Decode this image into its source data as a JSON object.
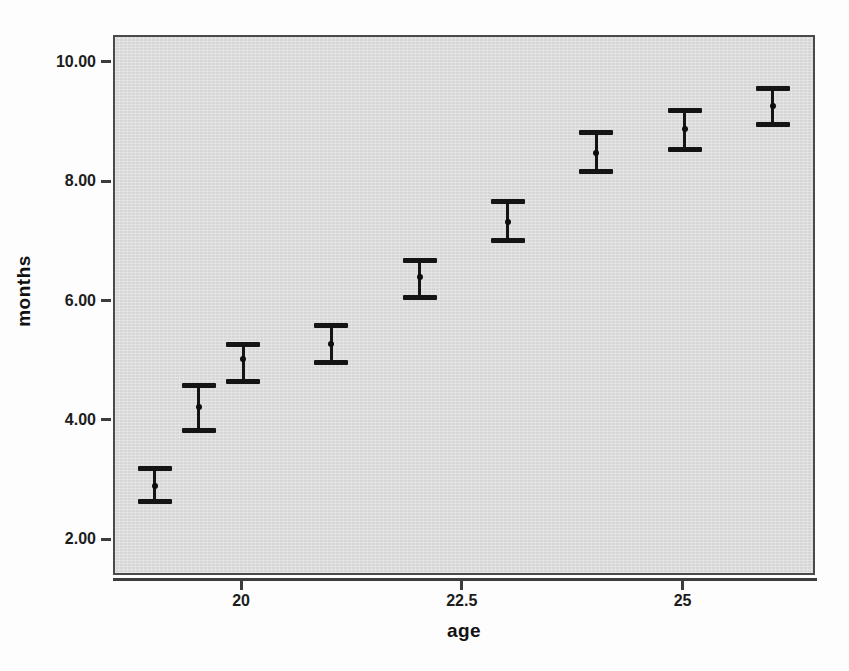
{
  "chart_data": {
    "type": "scatter",
    "title": "",
    "subtitle": "",
    "xlabel": "age",
    "ylabel": "months",
    "xlim": [
      18.55,
      26.5
    ],
    "ylim": [
      1.4,
      10.45
    ],
    "grid": false,
    "legend": null,
    "x_ticks": [
      "20",
      "22.5",
      "25"
    ],
    "x_tick_values": [
      20,
      22.5,
      25
    ],
    "y_ticks": [
      "10.00",
      "8.00",
      "6.00",
      "4.00",
      "2.00"
    ],
    "y_tick_values": [
      10,
      8,
      6,
      4,
      2
    ],
    "error_bar_description": "95% CI of mean months, capped error bars with centre point marker",
    "series": [
      {
        "name": "months",
        "x": [
          19.0,
          19.5,
          20.0,
          21.0,
          22.0,
          23.0,
          24.0,
          25.0,
          26.0
        ],
        "values": [
          2.93,
          4.25,
          5.05,
          5.3,
          6.42,
          7.35,
          8.5,
          8.9,
          9.3
        ],
        "upper": [
          3.23,
          4.62,
          5.3,
          5.63,
          6.72,
          7.7,
          8.85,
          9.22,
          9.6
        ],
        "lower": [
          2.68,
          3.87,
          4.68,
          5.0,
          6.1,
          7.05,
          8.2,
          8.57,
          9.0
        ]
      }
    ],
    "points": [
      {
        "label": "point-1",
        "x": 19.0,
        "mean": 2.93,
        "upper": 3.23,
        "lower": 2.68
      },
      {
        "label": "point-2",
        "x": 19.5,
        "mean": 4.25,
        "upper": 4.62,
        "lower": 3.87
      },
      {
        "label": "point-3",
        "x": 20.0,
        "mean": 5.05,
        "upper": 5.3,
        "lower": 4.68
      },
      {
        "label": "point-4",
        "x": 21.0,
        "mean": 5.3,
        "upper": 5.63,
        "lower": 5.0
      },
      {
        "label": "point-5",
        "x": 22.0,
        "mean": 6.42,
        "upper": 6.72,
        "lower": 6.1
      },
      {
        "label": "point-6",
        "x": 23.0,
        "mean": 7.35,
        "upper": 7.7,
        "lower": 7.05
      },
      {
        "label": "point-7",
        "x": 24.0,
        "mean": 8.5,
        "upper": 8.85,
        "lower": 8.2
      },
      {
        "label": "point-8",
        "x": 25.0,
        "mean": 8.9,
        "upper": 9.22,
        "lower": 8.57
      },
      {
        "label": "point-9",
        "x": 26.0,
        "mean": 9.3,
        "upper": 9.6,
        "lower": 9.0
      }
    ],
    "colors": {
      "plot_background": "#d7d7d7",
      "frame": "#4a4a4a",
      "marker": "#141414",
      "axis": "#3c3c3c",
      "text": "#111111",
      "page_background": "#fdfdfd"
    }
  }
}
